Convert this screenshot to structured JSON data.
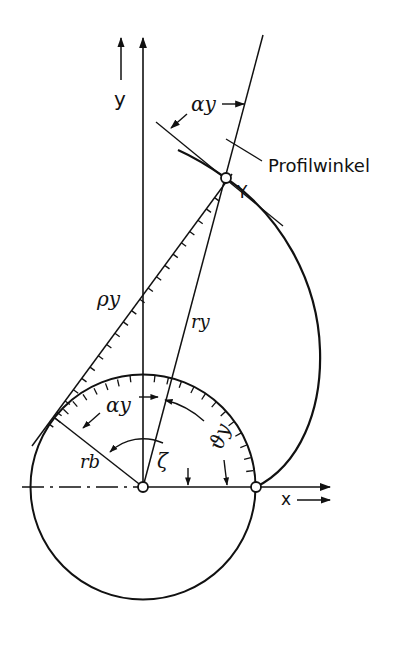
{
  "figure": {
    "type": "involute-geometry",
    "labels": {
      "axis_y": "y",
      "axis_x": "x",
      "point_y": "Y",
      "profile_angle_label": "Profilwinkel",
      "alpha_y_top": "αy",
      "alpha_y_inner": "αy",
      "rho_y": "ρy",
      "r_y": "ry",
      "r_b": "rb",
      "zeta": "ζ",
      "theta_y": "ϑy"
    },
    "colors": {
      "ink": "#111111",
      "background": "#ffffff"
    }
  }
}
